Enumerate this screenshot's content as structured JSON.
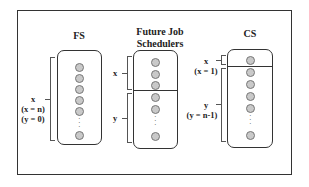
{
  "diagram": {
    "panels": [
      {
        "title": "FS",
        "groups": [
          {
            "label": "x",
            "sub1": "(x = n)",
            "sub2": "(y = 0)"
          }
        ]
      },
      {
        "title_line1": "Future Job",
        "title_line2": "Schedulers",
        "groups": [
          {
            "label": "x"
          },
          {
            "label": "y"
          }
        ]
      },
      {
        "title": "CS",
        "groups": [
          {
            "label": "x",
            "sub1": "(x = 1)"
          },
          {
            "label": "y",
            "sub1": "(y = n-1)"
          }
        ]
      }
    ],
    "ellipsis": "⋮"
  }
}
